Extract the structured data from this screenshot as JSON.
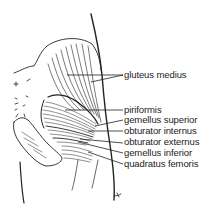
{
  "diagram": {
    "labels": [
      {
        "id": "gluteus-medius",
        "text": "gluteus medius",
        "x": 124,
        "y": 70,
        "line": {
          "x1": 67,
          "y1": 75,
          "x2": 123,
          "y2": 75
        }
      },
      {
        "id": "piriformis",
        "text": "piriformis",
        "x": 124,
        "y": 104,
        "line": {
          "x1": 65,
          "y1": 110,
          "x2": 123,
          "y2": 110
        }
      },
      {
        "id": "gemellus-superior",
        "text": "gemellus superior",
        "x": 124,
        "y": 115,
        "line": {
          "x1": 95,
          "y1": 126,
          "x2": 123,
          "y2": 120
        }
      },
      {
        "id": "obturator-internus",
        "text": "obturator internus",
        "x": 124,
        "y": 126,
        "line": {
          "x1": 88,
          "y1": 131,
          "x2": 123,
          "y2": 131
        }
      },
      {
        "id": "obturator-externus",
        "text": "obturator externus",
        "x": 124,
        "y": 137,
        "line": {
          "x1": 80,
          "y1": 139,
          "x2": 123,
          "y2": 143
        }
      },
      {
        "id": "gemellus-inferior",
        "text": "gemellus inferior",
        "x": 124,
        "y": 148,
        "line": {
          "x1": 78,
          "y1": 142,
          "x2": 123,
          "y2": 153
        }
      },
      {
        "id": "quadratus-femoris",
        "text": "quadratus femoris",
        "x": 124,
        "y": 159,
        "line": {
          "x1": 88,
          "y1": 152,
          "x2": 123,
          "y2": 164
        }
      }
    ],
    "colors": {
      "ink": "#222222",
      "background": "#ffffff"
    }
  }
}
